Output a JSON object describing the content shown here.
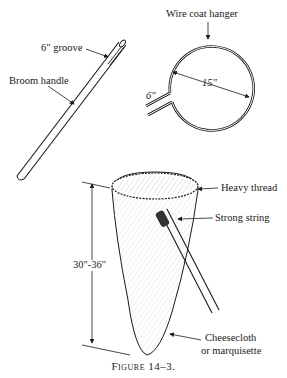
{
  "figure": {
    "caption": "Figure 14–3.",
    "colors": {
      "ink": "#1a1a1a",
      "background": "#ffffff"
    }
  },
  "broom_handle": {
    "label": "Broom handle",
    "groove_label": "6\" groove"
  },
  "hanger": {
    "label": "Wire coat hanger",
    "diameter_label": "15\"",
    "extension_label": "6\""
  },
  "net": {
    "rim_label": "Heavy thread",
    "binding_label": "Strong string",
    "length_label": "30\"-36\"",
    "material_label_line1": "Cheesecloth",
    "material_label_line2": "or marquisette"
  }
}
